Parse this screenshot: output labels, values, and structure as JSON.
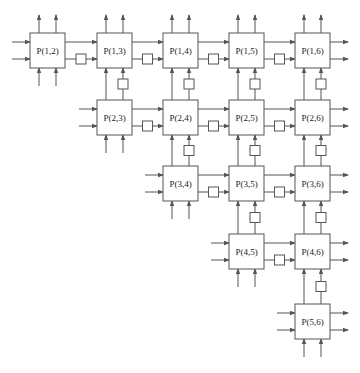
{
  "diagram": {
    "type": "systolic-array",
    "grid": {
      "col_x": [
        30,
        97,
        163,
        229,
        295
      ],
      "row_y": [
        33,
        100,
        166,
        234,
        304
      ],
      "box_size": 35
    },
    "processors": [
      {
        "label": "P(1,2)",
        "row": 0,
        "col": 0
      },
      {
        "label": "P(1,3)",
        "row": 0,
        "col": 1
      },
      {
        "label": "P(1,4)",
        "row": 0,
        "col": 2
      },
      {
        "label": "P(1,5)",
        "row": 0,
        "col": 3
      },
      {
        "label": "P(1,6)",
        "row": 0,
        "col": 4
      },
      {
        "label": "P(2,3)",
        "row": 1,
        "col": 1
      },
      {
        "label": "P(2,4)",
        "row": 1,
        "col": 2
      },
      {
        "label": "P(2,5)",
        "row": 1,
        "col": 3
      },
      {
        "label": "P(2,6)",
        "row": 1,
        "col": 4
      },
      {
        "label": "P(3,4)",
        "row": 2,
        "col": 2
      },
      {
        "label": "P(3,5)",
        "row": 2,
        "col": 3
      },
      {
        "label": "P(3,6)",
        "row": 2,
        "col": 4
      },
      {
        "label": "P(4,5)",
        "row": 3,
        "col": 3
      },
      {
        "label": "P(4,6)",
        "row": 3,
        "col": 4
      },
      {
        "label": "P(5,6)",
        "row": 4,
        "col": 4
      }
    ],
    "colors": {
      "stroke": "#555555",
      "fill": "#ffffff",
      "text": "#222222"
    }
  }
}
